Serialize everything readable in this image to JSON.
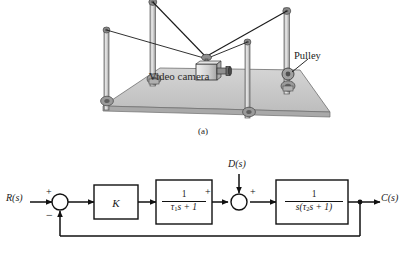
{
  "figure": {
    "caption_a": "(a)",
    "panel_a": {
      "camera_label": "Video camera",
      "pulley_label": "Pulley",
      "scene": "cable-suspended video camera supported by four poles with pulleys over a rectangular field"
    },
    "panel_b": {
      "input_label": "R(s)",
      "output_label": "C(s)",
      "disturbance_label": "D(s)",
      "gain_label": "K",
      "summer1": {
        "input_sign": "+",
        "feedback_sign": "−"
      },
      "summer2": {
        "left_sign": "+",
        "top_sign": "+"
      },
      "block1": {
        "numerator": "1",
        "denominator_tau": "τ",
        "denominator_sub": "1",
        "denominator_rest": "s + 1"
      },
      "block2": {
        "numerator": "1",
        "den_lead": "s(",
        "den_tau": "τ",
        "den_sub": "2",
        "den_rest": "s + 1)"
      }
    },
    "colors": {
      "line": "#111111",
      "platform_fill": "#c9c9c9",
      "pole_fill": "#d4d4d4",
      "label_text": "#1a1a1a"
    }
  }
}
